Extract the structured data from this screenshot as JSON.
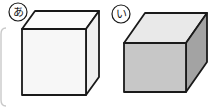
{
  "figure": {
    "background_color": "#ffffff",
    "width": 219,
    "height": 110,
    "edge_color": "#1a1a1a"
  },
  "frame": {
    "name": "page-border-fragment",
    "stroke": "#c9c9c9"
  },
  "shapes": [
    {
      "id": "box-a",
      "label": "あ",
      "label_color": "#1a1a1a",
      "shading": "unshaded",
      "front_face_color": "#f7f7f7",
      "top_face_color": "#fdfdfd",
      "side_face_color": "#f0f0f0",
      "outline_color": "#1a1a1a",
      "orientation": "tall",
      "front": {
        "x": 22,
        "y": 29,
        "w": 64,
        "h": 66
      },
      "depth_dx": 13,
      "depth_dy": -18
    },
    {
      "id": "box-i",
      "label": "い",
      "label_color": "#1a1a1a",
      "shading": "shaded",
      "front_face_color": "#c7c7c7",
      "top_face_color": "#e9e9e9",
      "side_face_color": "#a3a3a3",
      "outline_color": "#1a1a1a",
      "orientation": "wide",
      "front": {
        "x": 124,
        "y": 43,
        "w": 62,
        "h": 49
      },
      "depth_dx": 21,
      "depth_dy": -30
    }
  ],
  "labels": {
    "a": {
      "text": "あ",
      "cx": 18,
      "cy": 12,
      "r": 9
    },
    "i": {
      "text": "い",
      "cx": 121,
      "cy": 14,
      "r": 9
    }
  }
}
